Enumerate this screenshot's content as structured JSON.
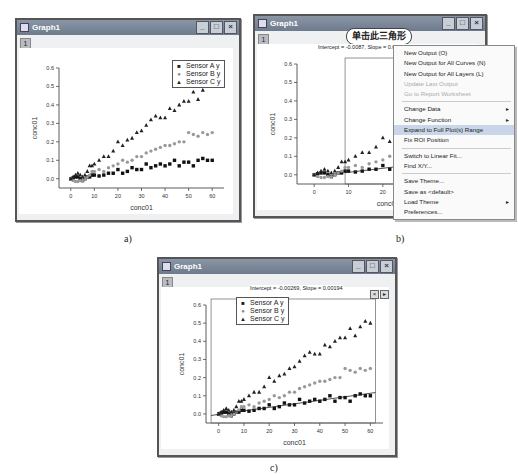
{
  "panels": [
    {
      "id": "a",
      "caption": "a)",
      "window_title": "Graph1",
      "layer_tab": "1",
      "title_buttons": [
        "minimize",
        "maximize",
        "close"
      ],
      "legend": [
        {
          "symbol": "■",
          "label": "Sensor A y"
        },
        {
          "symbol": "●",
          "label": "Sensor B y"
        },
        {
          "symbol": "▲",
          "label": "Sensor C y"
        }
      ]
    },
    {
      "id": "b",
      "caption": "b)",
      "window_title": "Graph1",
      "layer_tab": "1",
      "title_buttons": [
        "minimize",
        "maximize",
        "close"
      ],
      "legend": [
        {
          "symbol": "■",
          "label": "Sensor A y"
        },
        {
          "symbol": "●",
          "label": "Sensor B y"
        }
      ],
      "roi_label": "Intercept = -0.0087, Slope = 0.00219",
      "callout": "单击此三角形",
      "roi_buttons": [
        "×",
        "▸"
      ],
      "context_menu": [
        {
          "label": "New Output (O)",
          "state": "normal"
        },
        {
          "label": "New Output for All Curves (N)",
          "state": "normal"
        },
        {
          "label": "New Output for All Layers (L)",
          "state": "normal"
        },
        {
          "label": "Update Last Output",
          "state": "disabled"
        },
        {
          "label": "Go to Report Worksheet",
          "state": "disabled"
        },
        {
          "sep": true
        },
        {
          "label": "Change Data",
          "state": "normal",
          "submenu": true
        },
        {
          "label": "Change Function",
          "state": "normal",
          "submenu": true
        },
        {
          "label": "Expand to Full Plot(s) Range",
          "state": "highlighted"
        },
        {
          "label": "Fix ROI Position",
          "state": "normal"
        },
        {
          "sep": true
        },
        {
          "label": "Switch to Linear Fit...",
          "state": "normal"
        },
        {
          "label": "Find X/Y...",
          "state": "normal"
        },
        {
          "sep": true
        },
        {
          "label": "Save Theme...",
          "state": "normal"
        },
        {
          "label": "Save as <default>",
          "state": "normal"
        },
        {
          "label": "Load Theme",
          "state": "normal",
          "submenu": true
        },
        {
          "label": "Preferences...",
          "state": "normal"
        }
      ]
    },
    {
      "id": "c",
      "caption": "c)",
      "window_title": "Graph1",
      "layer_tab": "1",
      "title_buttons": [
        "minimize",
        "maximize",
        "close"
      ],
      "legend": [
        {
          "symbol": "■",
          "label": "Sensor A y"
        },
        {
          "symbol": "●",
          "label": "Sensor B y"
        },
        {
          "symbol": "▲",
          "label": "Sensor C y"
        }
      ],
      "roi_label": "Intercept = -0.00269, Slope = 0.00194",
      "roi_buttons": [
        "×",
        "▸"
      ]
    }
  ],
  "chart_data": {
    "type": "scatter",
    "title": "",
    "xlabel": "conc01",
    "ylabel": "conc01",
    "xlim": [
      -5,
      65
    ],
    "ylim": [
      -0.05,
      0.6
    ],
    "xticks": [
      0,
      10,
      20,
      30,
      40,
      50,
      60
    ],
    "yticks": [
      0.0,
      0.1,
      0.2,
      0.3,
      0.4,
      0.5,
      0.6
    ],
    "x": [
      0,
      1,
      2,
      3,
      4,
      5,
      6,
      7,
      8,
      9,
      10,
      12,
      14,
      16,
      18,
      20,
      22,
      24,
      26,
      28,
      30,
      32,
      34,
      36,
      38,
      40,
      42,
      44,
      46,
      48,
      50,
      52,
      54,
      56,
      58,
      60
    ],
    "series": [
      {
        "name": "Sensor A y",
        "marker": "square",
        "values": [
          0.0,
          0.005,
          0.01,
          0.01,
          0.0,
          -0.01,
          0.0,
          0.01,
          0.01,
          0.02,
          0.02,
          0.015,
          0.02,
          0.03,
          0.03,
          0.05,
          0.03,
          0.04,
          0.06,
          0.05,
          0.05,
          0.08,
          0.06,
          0.07,
          0.08,
          0.07,
          0.08,
          0.1,
          0.07,
          0.09,
          0.09,
          0.07,
          0.1,
          0.11,
          0.1,
          0.1
        ]
      },
      {
        "name": "Sensor B y",
        "marker": "circle",
        "values": [
          0.0,
          -0.01,
          -0.015,
          -0.015,
          -0.01,
          -0.01,
          0.0,
          0.01,
          0.02,
          0.04,
          0.04,
          0.05,
          0.04,
          0.06,
          0.07,
          0.08,
          0.1,
          0.09,
          0.1,
          0.12,
          0.12,
          0.14,
          0.15,
          0.16,
          0.17,
          0.18,
          0.18,
          0.19,
          0.2,
          0.2,
          0.25,
          0.24,
          0.23,
          0.25,
          0.24,
          0.25
        ]
      },
      {
        "name": "Sensor C y",
        "marker": "triangle",
        "values": [
          0.0,
          0.01,
          0.02,
          0.03,
          0.02,
          0.01,
          0.02,
          0.04,
          0.07,
          0.07,
          0.08,
          0.1,
          0.12,
          0.12,
          0.15,
          0.2,
          0.18,
          0.21,
          0.22,
          0.25,
          0.26,
          0.29,
          0.32,
          0.34,
          0.33,
          0.33,
          0.38,
          0.37,
          0.4,
          0.42,
          0.42,
          0.47,
          0.43,
          0.48,
          0.51,
          0.5
        ]
      }
    ],
    "fit_lines": [
      {
        "panel": "b",
        "x_range": [
          9,
          45
        ],
        "intercept": -0.0087,
        "slope": 0.00219
      },
      {
        "panel": "c",
        "x_range": [
          -3,
          62
        ],
        "intercept": -0.00269,
        "slope": 0.00194
      }
    ]
  }
}
